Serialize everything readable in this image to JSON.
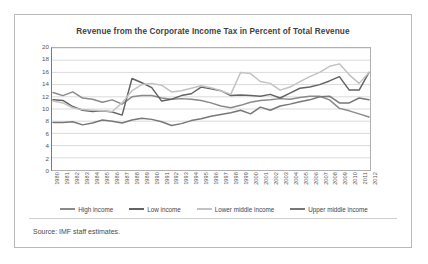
{
  "title": "Revenue from the Corporate Income Tax in Percent of Total Revenue",
  "source": "Source: IMF staff estimates.",
  "legend": [
    {
      "label": "High income",
      "color": "#8a8a8a"
    },
    {
      "label": "Low income",
      "color": "#636363"
    },
    {
      "label": "Lower middle income",
      "color": "#c2c2c2"
    },
    {
      "label": "Upper middle income",
      "color": "#777777"
    }
  ],
  "chart_data": {
    "type": "line",
    "title": "Revenue from the Corporate Income Tax in Percent of Total Revenue",
    "xlabel": "",
    "ylabel": "",
    "ylim": [
      0,
      20
    ],
    "yticks": [
      0,
      2,
      4,
      6,
      8,
      10,
      12,
      14,
      16,
      18,
      20
    ],
    "grid": true,
    "legend_position": "bottom",
    "categories": [
      "1980",
      "1981",
      "1982",
      "1983",
      "1984",
      "1985",
      "1986",
      "1987",
      "1988",
      "1989",
      "1990",
      "1991",
      "1992",
      "1993",
      "1994",
      "1995",
      "1996",
      "1997",
      "1998",
      "1999",
      "2000",
      "2001",
      "2002",
      "2003",
      "2004",
      "2005",
      "2006",
      "2007",
      "2008",
      "2009",
      "2010",
      "2011",
      "2012"
    ],
    "series": [
      {
        "name": "High income",
        "color": "#8a8a8a",
        "values": [
          12.7,
          12.2,
          12.8,
          11.8,
          11.6,
          11.1,
          11.5,
          10.8,
          12.0,
          12.2,
          12.2,
          11.8,
          11.6,
          11.7,
          11.6,
          11.4,
          11.0,
          10.5,
          10.2,
          10.6,
          11.1,
          11.4,
          11.5,
          11.7,
          11.6,
          11.9,
          12.1,
          12.1,
          11.5,
          10.1,
          9.7,
          9.2,
          8.7
        ]
      },
      {
        "name": "Low income",
        "color": "#636363",
        "values": [
          11.5,
          11.4,
          10.4,
          9.8,
          9.6,
          9.7,
          9.5,
          9.0,
          15.0,
          14.3,
          13.5,
          11.3,
          11.6,
          12.2,
          12.5,
          13.6,
          13.3,
          13.0,
          12.2,
          12.3,
          12.2,
          12.1,
          12.4,
          11.8,
          12.6,
          13.4,
          13.6,
          14.0,
          14.6,
          15.3,
          13.1,
          13.1,
          16.0
        ]
      },
      {
        "name": "Lower middle income",
        "color": "#c2c2c2",
        "values": [
          11.3,
          11.0,
          10.2,
          9.9,
          9.8,
          9.7,
          9.6,
          11.0,
          13.0,
          14.0,
          14.2,
          13.9,
          12.8,
          13.0,
          13.4,
          13.8,
          13.5,
          13.0,
          12.4,
          16.0,
          15.8,
          14.5,
          14.2,
          13.1,
          13.6,
          14.5,
          15.3,
          16.0,
          17.0,
          17.4,
          15.6,
          14.2,
          16.0
        ]
      },
      {
        "name": "Upper middle income",
        "color": "#777777",
        "values": [
          7.8,
          7.8,
          7.9,
          7.4,
          7.7,
          8.2,
          8.0,
          7.7,
          8.2,
          8.5,
          8.3,
          7.9,
          7.3,
          7.6,
          8.1,
          8.4,
          8.8,
          9.1,
          9.4,
          9.8,
          9.2,
          10.3,
          9.8,
          10.5,
          10.8,
          11.2,
          11.5,
          12.0,
          12.1,
          11.0,
          11.0,
          11.8,
          11.5
        ]
      }
    ]
  }
}
